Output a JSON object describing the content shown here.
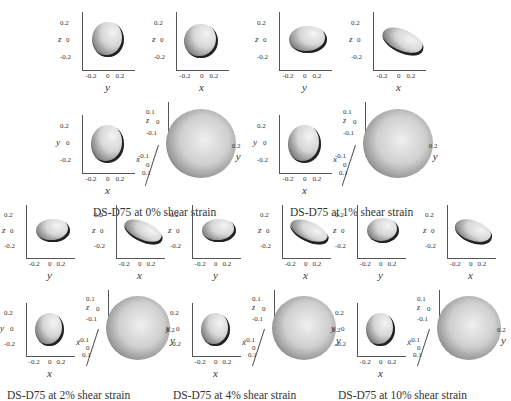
{
  "figure": {
    "groups": [
      {
        "caption": "DS-D75 at 0% shear strain",
        "strain": "0%"
      },
      {
        "caption": "DS-D75 at 1% shear strain",
        "strain": "1%"
      },
      {
        "caption": "DS-D75 at 2% shear strain",
        "strain": "2%"
      },
      {
        "caption": "DS-D75 at 4% shear strain",
        "strain": "4%"
      },
      {
        "caption": "DS-D75 at 10% shear strain",
        "strain": "10%"
      }
    ],
    "ticks": {
      "neg": "-0.2",
      "zero": "0",
      "pos": "0.2",
      "neg1": "-0.1",
      "pos1": "0.1"
    },
    "labels": {
      "x": "x",
      "y": "y",
      "z": "z"
    },
    "views": [
      "y-z projection",
      "x-z projection",
      "x-y projection",
      "3D view"
    ]
  }
}
